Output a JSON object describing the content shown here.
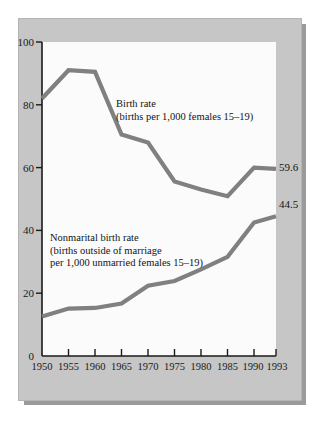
{
  "chart_data": {
    "type": "line",
    "title": "",
    "subtitle": "",
    "xlabel": "",
    "ylabel": "",
    "x": [
      1950,
      1955,
      1960,
      1965,
      1970,
      1975,
      1980,
      1985,
      1990,
      1993
    ],
    "categories": [
      "1950",
      "1955",
      "1960",
      "1965",
      "1970",
      "1975",
      "1980",
      "1985",
      "1990",
      "1993"
    ],
    "xtick_labels": [
      "1950",
      "1955",
      "1960",
      "1965",
      "1970",
      "1975",
      "1980",
      "1985",
      "1990",
      "1993"
    ],
    "ytick_labels": [
      "0",
      "20",
      "40",
      "60",
      "80",
      "100"
    ],
    "yticks": [
      0,
      20,
      40,
      60,
      80,
      100
    ],
    "ylim": [
      0,
      100
    ],
    "xlim": [
      1950,
      1993
    ],
    "grid": false,
    "legend_position": "inline-annotation",
    "series": [
      {
        "name": "Birth rate",
        "annotation_lines": [
          "Birth rate",
          "(births per 1,000 females 15–19)"
        ],
        "values": [
          82,
          91,
          90.5,
          70.5,
          68,
          55.6,
          53,
          50.9,
          60,
          59.6
        ],
        "end_label": "59.6",
        "color": "#808080"
      },
      {
        "name": "Nonmarital birth rate",
        "annotation_lines": [
          "Nonmarital birth rate",
          "(births outside of marriage",
          "per 1,000 unmarried females 15–19)"
        ],
        "values": [
          12.6,
          15.1,
          15.3,
          16.7,
          22.4,
          23.9,
          27.6,
          31.6,
          42.5,
          44.5
        ],
        "end_label": "44.5",
        "color": "#808080"
      }
    ]
  },
  "figure": {
    "panel_color": "#c6c6c6",
    "plot_background": "#fbfbfb",
    "axis_color": "#1a1a1a",
    "line_color": "#808080"
  }
}
